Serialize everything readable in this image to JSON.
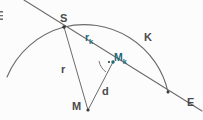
{
  "diagram": {
    "background_color": "#fcfcfc",
    "line_color": "#6b6b6e",
    "label_color": "#4a4a4d",
    "accent_color": "#1d6878",
    "edge_glyph": "E",
    "labels": {
      "arc_label": "K",
      "intersection_point": "S",
      "chord_label": "rₖ",
      "chord_base": "r",
      "chord_sub": "k",
      "midpoint_label": "Mₖ",
      "midpoint_base": "M",
      "midpoint_sub": "k",
      "radius_label": "r",
      "center_label": "M",
      "distance_label": "d",
      "line_end_label": "E"
    },
    "points": {
      "S": {
        "x": 64,
        "y": 27,
        "label": "S"
      },
      "M": {
        "x": 88,
        "y": 110,
        "label": "M"
      },
      "Mk": {
        "x": 113,
        "y": 62,
        "label": "Mₖ"
      },
      "E_intersection": {
        "x": 168,
        "y": 92,
        "label": ""
      }
    },
    "segments": [
      {
        "name": "radius-r",
        "from": "S",
        "to": "M",
        "label": "r"
      },
      {
        "name": "distance-d",
        "from": "M",
        "to": "Mk",
        "label": "d"
      },
      {
        "name": "chord-rk",
        "from": "S",
        "to": "Mk",
        "label": "rₖ"
      }
    ],
    "markers": {
      "right_angle": "right-angle-arc-with-dot"
    }
  }
}
